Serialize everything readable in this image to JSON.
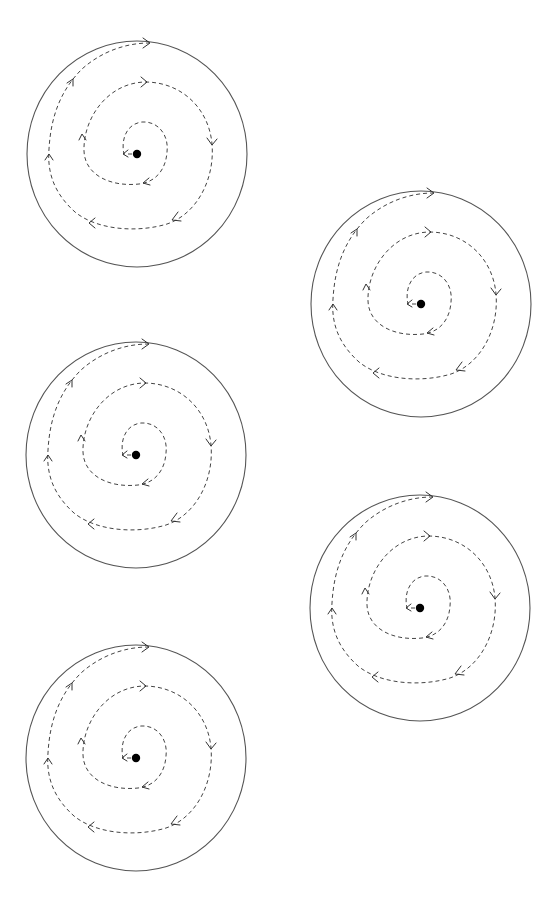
{
  "diagram": {
    "colors": {
      "stroke": "#555555",
      "dashed": "#444444",
      "dot": "#000000",
      "background": "#ffffff"
    },
    "figures": [
      {
        "id": "spiral-1",
        "center": [
          137,
          154
        ],
        "rx": 110,
        "ry": 113
      },
      {
        "id": "spiral-2",
        "center": [
          421,
          304
        ],
        "rx": 110,
        "ry": 113
      },
      {
        "id": "spiral-3",
        "center": [
          136,
          455
        ],
        "rx": 109,
        "ry": 113
      },
      {
        "id": "spiral-4",
        "center": [
          420,
          608
        ],
        "rx": 110,
        "ry": 113
      },
      {
        "id": "spiral-5",
        "center": [
          136,
          758
        ],
        "rx": 109,
        "ry": 113
      }
    ],
    "spiral": {
      "turns": 2.5,
      "direction": "outward-clockwise",
      "arrow_count": 11,
      "start_arrow": "left"
    }
  }
}
